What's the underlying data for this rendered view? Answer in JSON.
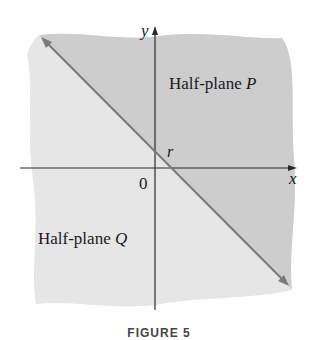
{
  "figure": {
    "caption": "FIGURE 5",
    "axes": {
      "x_label": "x",
      "y_label": "y",
      "origin_label": "0"
    },
    "line": {
      "intercept_label": "r",
      "color": "#7a7a7a"
    },
    "regions": [
      {
        "name": "Half-plane P",
        "prefix": "Half-plane ",
        "var": "P",
        "fill": "#cdcdcd"
      },
      {
        "name": "Half-plane Q",
        "prefix": "Half-plane ",
        "var": "Q",
        "fill": "#e6e6e6"
      }
    ]
  }
}
